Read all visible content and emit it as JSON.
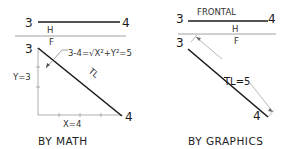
{
  "left_panel": {
    "caption": "BY MATH",
    "top_view": {
      "start_label": "3",
      "end_label": "4"
    },
    "fold_line": {
      "upper_label": "H",
      "lower_label": "F"
    },
    "front_view": {
      "start_label": "3",
      "end_label": "4",
      "line_label": "TL"
    },
    "formula": "3-4=√X²+Y²=5",
    "y_label": "Y=3",
    "x_label": "X=4"
  },
  "right_panel": {
    "caption": "BY GRAPHICS",
    "top_view": {
      "start_label": "3",
      "end_label": "4",
      "line_label": "FRONTAL"
    },
    "fold_line": {
      "upper_label": "H",
      "lower_label": "F"
    },
    "front_view": {
      "start_label": "3",
      "end_label": "4"
    },
    "dimension_label": "TL=5"
  },
  "colors": {
    "line": "#1a1a1a",
    "thin_line": "#888888",
    "background": "#ffffff"
  }
}
